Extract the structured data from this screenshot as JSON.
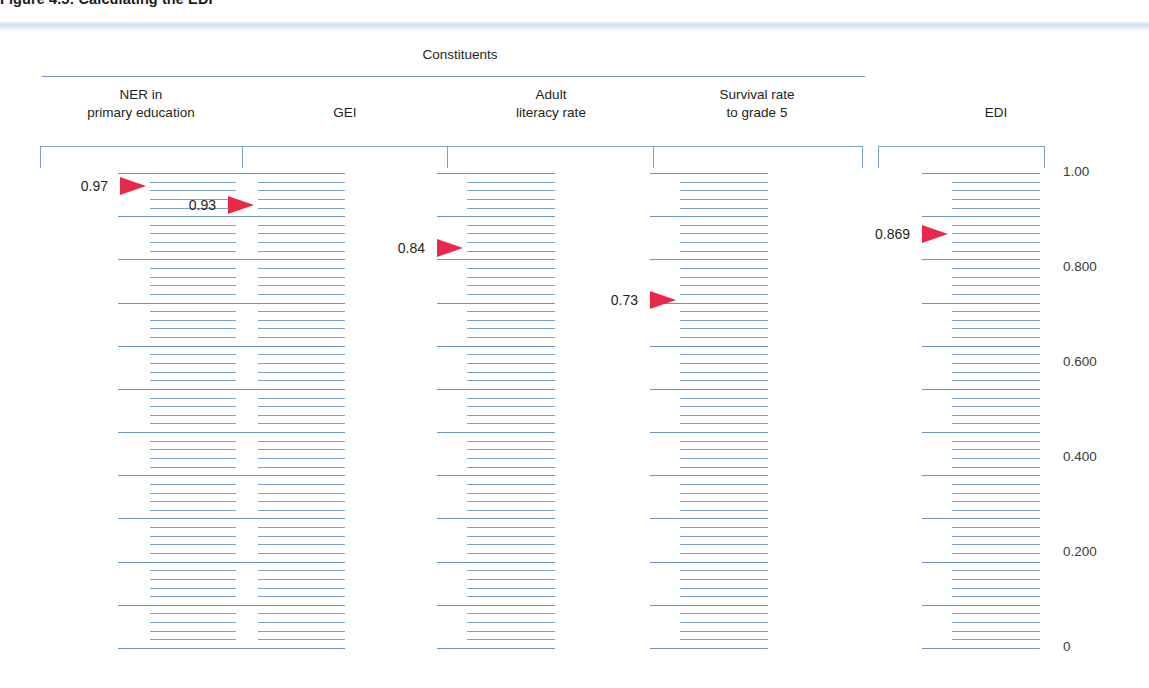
{
  "figure": {
    "title": "Figure 4.5: Calculating the EDI",
    "group_label": "Constituents"
  },
  "axis": {
    "ticks": [
      {
        "label": "1.00",
        "value": 1.0
      },
      {
        "label": "0.800",
        "value": 0.8
      },
      {
        "label": "0.600",
        "value": 0.6
      },
      {
        "label": "0.400",
        "value": 0.4
      },
      {
        "label": "0.200",
        "value": 0.2
      },
      {
        "label": "0",
        "value": 0.0
      }
    ]
  },
  "columns": [
    {
      "id": "ner",
      "header_line1": "NER in",
      "header_line2": "primary education",
      "annotation": "0.97",
      "value": 0.97
    },
    {
      "id": "gei",
      "header_line1": "GEI",
      "header_line2": "",
      "annotation": "0.93",
      "value": 0.93
    },
    {
      "id": "adult-literacy",
      "header_line1": "Adult",
      "header_line2": "literacy rate",
      "annotation": "0.84",
      "value": 0.84
    },
    {
      "id": "survival-grade5",
      "header_line1": "Survival rate",
      "header_line2": "to grade 5",
      "annotation": "0.73",
      "value": 0.73
    },
    {
      "id": "edi",
      "header_line1": "EDI",
      "header_line2": "",
      "annotation": "0.869",
      "value": 0.869
    }
  ],
  "colors": {
    "rule": "#6f93bb",
    "rung": "#7ea2c8",
    "arrow": "#e8294a",
    "band": "#cfe0ee",
    "text": "#231f20"
  },
  "chart_data": {
    "type": "bar",
    "title": "Calculating the EDI",
    "subtitle": "Constituents",
    "categories": [
      "NER in primary education",
      "GEI",
      "Adult literacy rate",
      "Survival rate to grade 5",
      "EDI"
    ],
    "values": [
      0.97,
      0.93,
      0.84,
      0.73,
      0.869
    ],
    "data_labels": [
      "0.97",
      "0.93",
      "0.84",
      "0.73",
      "0.869"
    ],
    "xlabel": "",
    "ylabel": "",
    "ylim": [
      0,
      1.0
    ],
    "ytick_labels": [
      "0",
      "0.200",
      "0.400",
      "0.600",
      "0.800",
      "1.00"
    ],
    "ytick_values": [
      0,
      0.2,
      0.4,
      0.6,
      0.8,
      1.0
    ],
    "grid": true,
    "legend": "none"
  }
}
